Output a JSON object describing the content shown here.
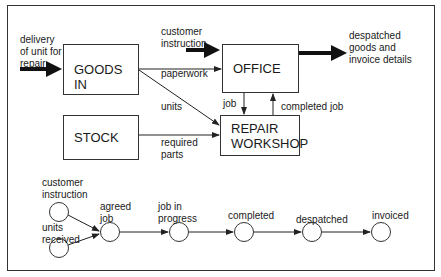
{
  "boxes": {
    "goods_in": "GOODS IN",
    "office": "OFFICE",
    "stock": "STOCK",
    "repair_1": "REPAIR",
    "repair_2": "WORKSHOP"
  },
  "flows": {
    "delivery_1": "delivery",
    "delivery_2": "of unit for",
    "delivery_3": "repair",
    "customer_instruction_1": "customer",
    "customer_instruction_2": "instruction",
    "paperwork": "paperwork",
    "units": "units",
    "required_parts_1": "required",
    "required_parts_2": "parts",
    "job": "job",
    "completed_job": "completed job",
    "despatched_1": "despatched",
    "despatched_2": "goods and",
    "despatched_3": "invoice details"
  },
  "states": {
    "customer_instruction_1": "customer",
    "customer_instruction_2": "instruction",
    "units_received_1": "units",
    "units_received_2": "received",
    "agreed_job_1": "agreed",
    "agreed_job_2": "job",
    "job_in_progress_1": "job in",
    "job_in_progress_2": "progress",
    "completed": "completed",
    "despatched": "despatched",
    "invoiced": "invoiced"
  }
}
